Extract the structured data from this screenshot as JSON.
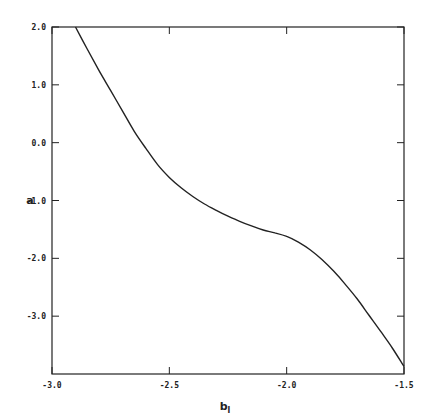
{
  "chart_data": {
    "type": "line",
    "title": "",
    "xlabel": "b_l",
    "ylabel": "a",
    "xlim": [
      -3.0,
      -1.5
    ],
    "ylim": [
      -4.0,
      2.0
    ],
    "grid": false,
    "legend": null,
    "x_ticks": [
      "-3.0",
      "-2.5",
      "-2.0",
      "-1.5"
    ],
    "y_ticks": [
      "2.0",
      "1.0",
      "0.0",
      "-1.0",
      "-2.0",
      "-3.0"
    ],
    "series": [
      {
        "name": "a(b_l)",
        "x": [
          -2.9,
          -2.85,
          -2.8,
          -2.75,
          -2.7,
          -2.65,
          -2.6,
          -2.55,
          -2.5,
          -2.45,
          -2.4,
          -2.35,
          -2.3,
          -2.25,
          -2.2,
          -2.15,
          -2.1,
          -2.05,
          -2.0,
          -1.95,
          -1.9,
          -1.85,
          -1.8,
          -1.75,
          -1.7,
          -1.65,
          -1.6,
          -1.55,
          -1.5
        ],
        "values": [
          2.0,
          1.62,
          1.25,
          0.9,
          0.55,
          0.2,
          -0.1,
          -0.38,
          -0.6,
          -0.78,
          -0.93,
          -1.06,
          -1.17,
          -1.27,
          -1.36,
          -1.44,
          -1.51,
          -1.56,
          -1.62,
          -1.72,
          -1.85,
          -2.02,
          -2.22,
          -2.45,
          -2.7,
          -2.98,
          -3.26,
          -3.55,
          -3.87
        ]
      }
    ]
  },
  "axes": {
    "x_label_main": "b",
    "x_label_sub": "l",
    "y_label": "a"
  }
}
